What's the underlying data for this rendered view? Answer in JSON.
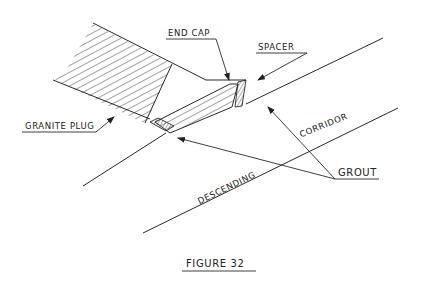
{
  "figure": {
    "caption": "Figure 32",
    "labels": {
      "end_cap": "End Cap",
      "spacer": "Spacer",
      "granite_plug": "Granite Plug",
      "grout": "Grout",
      "corridor": "Corridor",
      "descending": "Descending"
    },
    "colors": {
      "ink": "#2a2a2a",
      "background": "#ffffff"
    }
  }
}
